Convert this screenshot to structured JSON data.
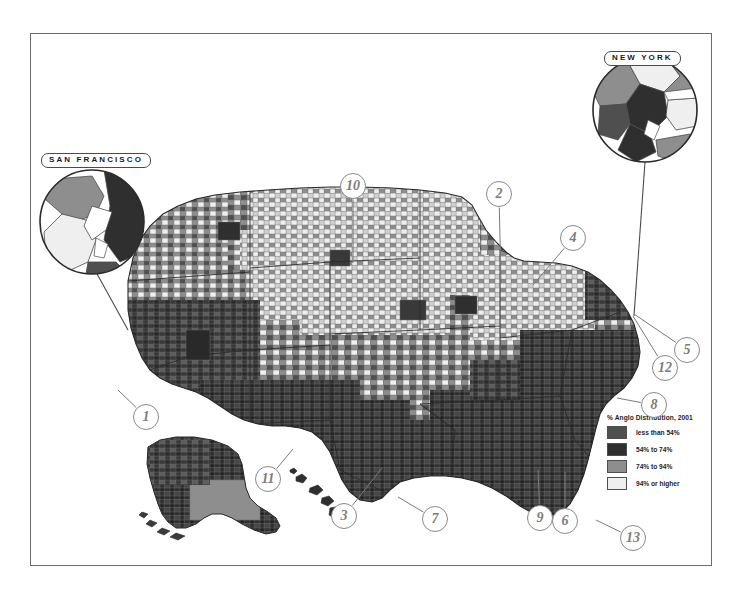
{
  "figure": {
    "type": "choropleth-map",
    "region": "United States (county level), with Alaska and Hawaii insets"
  },
  "legend": {
    "title": "% Anglo Distribution, 2001",
    "entries": [
      {
        "label": "less than 54%",
        "color": "#4f4f4f"
      },
      {
        "label": "54% to 74%",
        "color": "#2f2f2f"
      },
      {
        "label": "74% to 94%",
        "color": "#8e8e8e"
      },
      {
        "label": "94% or higher",
        "color": "#efefef"
      }
    ]
  },
  "insets": [
    {
      "id": "san-francisco",
      "label": "SAN FRANCISCO"
    },
    {
      "id": "new-york",
      "label": "NEW YORK"
    }
  ],
  "markers": [
    {
      "id": 1,
      "label": "1",
      "x": 146,
      "y": 417,
      "anchor_x": 118,
      "anchor_y": 390
    },
    {
      "id": 2,
      "label": "2",
      "x": 499,
      "y": 194,
      "anchor_x": 501,
      "anchor_y": 283
    },
    {
      "id": 3,
      "label": "3",
      "x": 344,
      "y": 516,
      "anchor_x": 382,
      "anchor_y": 468
    },
    {
      "id": 4,
      "label": "4",
      "x": 573,
      "y": 238,
      "anchor_x": 533,
      "anchor_y": 285
    },
    {
      "id": 5,
      "label": "5",
      "x": 687,
      "y": 350,
      "anchor_x": 634,
      "anchor_y": 314
    },
    {
      "id": 6,
      "label": "6",
      "x": 565,
      "y": 521,
      "anchor_x": 565,
      "anchor_y": 472
    },
    {
      "id": 7,
      "label": "7",
      "x": 435,
      "y": 519,
      "anchor_x": 398,
      "anchor_y": 497
    },
    {
      "id": 8,
      "label": "8",
      "x": 654,
      "y": 405,
      "anchor_x": 617,
      "anchor_y": 398
    },
    {
      "id": 9,
      "label": "9",
      "x": 540,
      "y": 518,
      "anchor_x": 538,
      "anchor_y": 470
    },
    {
      "id": 10,
      "label": "10",
      "x": 353,
      "y": 186,
      "anchor_x": 353,
      "anchor_y": 263
    },
    {
      "id": 11,
      "label": "11",
      "x": 268,
      "y": 479,
      "anchor_x": 293,
      "anchor_y": 449
    },
    {
      "id": 12,
      "label": "12",
      "x": 665,
      "y": 368,
      "anchor_x": 633,
      "anchor_y": 316
    },
    {
      "id": 13,
      "label": "13",
      "x": 633,
      "y": 538,
      "anchor_x": 596,
      "anchor_y": 520
    }
  ],
  "colors": {
    "frame_stroke": "#6b6b6b",
    "marker_stroke": "#8a8a8a",
    "marker_text": "#7c7c7c",
    "leader_line": "#7a7a7a",
    "county_stroke": "#6d6d6d",
    "state_stroke": "#2a2a2a",
    "background": "#ffffff"
  }
}
